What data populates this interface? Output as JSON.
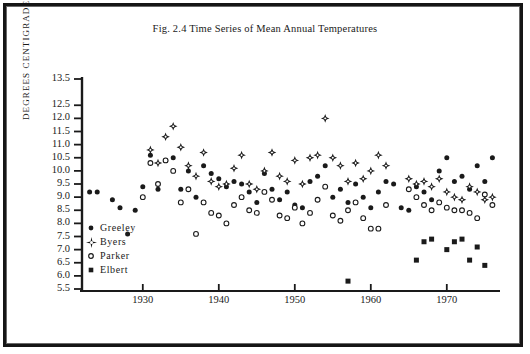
{
  "figure": {
    "title": "Fig. 2.4 Time Series of Mean Annual Temperatures",
    "ylabel": "DEGREES CENTIGRADE"
  },
  "legend": {
    "items": [
      {
        "label": "Greeley",
        "marker": "filled-circle"
      },
      {
        "label": "Byers",
        "marker": "star"
      },
      {
        "label": "Parker",
        "marker": "open-circle"
      },
      {
        "label": "Elbert",
        "marker": "filled-square"
      }
    ]
  },
  "chart_data": {
    "type": "scatter",
    "title": "Fig. 2.4 Time Series of Mean Annual Temperatures",
    "xlabel": "",
    "ylabel": "DEGREES CENTIGRADE",
    "xlim": [
      1922,
      1977
    ],
    "ylim": [
      5.5,
      13.5
    ],
    "grid": false,
    "legend_position": "inside-left",
    "xticks": [
      1930,
      1940,
      1950,
      1960,
      1970
    ],
    "yticks": [
      5.5,
      6.0,
      6.5,
      7.0,
      7.5,
      8.0,
      8.5,
      9.0,
      9.5,
      10.0,
      10.5,
      11.0,
      11.5,
      12.0,
      12.5,
      13.5
    ],
    "ytick_labels": [
      "5.5",
      "6.0",
      "6.5",
      "7.0",
      "7.5",
      "8.0",
      "8.5",
      "9.0",
      "9.5",
      "10.0",
      "10.5",
      "11.0",
      "11.5",
      "12.0",
      "12.5",
      "13.5"
    ],
    "series": [
      {
        "name": "Greeley",
        "marker": "filled-circle",
        "color": "#1a1a1a",
        "points": [
          [
            1923,
            9.2
          ],
          [
            1924,
            9.2
          ],
          [
            1926,
            8.9
          ],
          [
            1927,
            8.6
          ],
          [
            1928,
            7.6
          ],
          [
            1929,
            8.5
          ],
          [
            1930,
            9.4
          ],
          [
            1931,
            10.6
          ],
          [
            1932,
            9.3
          ],
          [
            1933,
            10.4
          ],
          [
            1934,
            10.5
          ],
          [
            1935,
            9.3
          ],
          [
            1936,
            10.0
          ],
          [
            1937,
            9.0
          ],
          [
            1938,
            10.2
          ],
          [
            1939,
            9.9
          ],
          [
            1940,
            9.7
          ],
          [
            1941,
            9.4
          ],
          [
            1942,
            9.6
          ],
          [
            1943,
            9.5
          ],
          [
            1944,
            9.2
          ],
          [
            1945,
            8.8
          ],
          [
            1946,
            9.9
          ],
          [
            1947,
            9.3
          ],
          [
            1948,
            8.9
          ],
          [
            1949,
            9.2
          ],
          [
            1950,
            8.7
          ],
          [
            1951,
            8.6
          ],
          [
            1952,
            9.6
          ],
          [
            1953,
            9.8
          ],
          [
            1954,
            10.2
          ],
          [
            1955,
            9.0
          ],
          [
            1956,
            9.3
          ],
          [
            1957,
            8.8
          ],
          [
            1958,
            9.5
          ],
          [
            1959,
            9.0
          ],
          [
            1960,
            8.6
          ],
          [
            1961,
            9.2
          ],
          [
            1962,
            9.6
          ],
          [
            1963,
            9.5
          ],
          [
            1964,
            8.6
          ],
          [
            1965,
            8.5
          ],
          [
            1966,
            9.4
          ],
          [
            1967,
            9.2
          ],
          [
            1968,
            8.9
          ],
          [
            1969,
            10.0
          ],
          [
            1970,
            10.5
          ],
          [
            1971,
            9.6
          ],
          [
            1972,
            9.8
          ],
          [
            1973,
            9.3
          ],
          [
            1974,
            10.2
          ],
          [
            1975,
            9.6
          ],
          [
            1976,
            10.5
          ]
        ]
      },
      {
        "name": "Byers",
        "marker": "star",
        "color": "#1a1a1a",
        "points": [
          [
            1931,
            10.8
          ],
          [
            1932,
            10.3
          ],
          [
            1933,
            11.3
          ],
          [
            1934,
            11.7
          ],
          [
            1935,
            10.9
          ],
          [
            1936,
            10.2
          ],
          [
            1937,
            9.8
          ],
          [
            1938,
            10.7
          ],
          [
            1939,
            9.6
          ],
          [
            1940,
            9.4
          ],
          [
            1941,
            9.5
          ],
          [
            1942,
            10.1
          ],
          [
            1943,
            10.6
          ],
          [
            1944,
            9.5
          ],
          [
            1945,
            9.3
          ],
          [
            1946,
            10.0
          ],
          [
            1947,
            10.7
          ],
          [
            1948,
            9.8
          ],
          [
            1949,
            9.6
          ],
          [
            1950,
            10.4
          ],
          [
            1951,
            9.5
          ],
          [
            1952,
            10.5
          ],
          [
            1953,
            10.6
          ],
          [
            1954,
            12.0
          ],
          [
            1955,
            10.5
          ],
          [
            1956,
            10.2
          ],
          [
            1957,
            9.6
          ],
          [
            1958,
            10.3
          ],
          [
            1959,
            9.7
          ],
          [
            1960,
            10.0
          ],
          [
            1961,
            10.6
          ],
          [
            1962,
            10.2
          ],
          [
            1965,
            9.7
          ],
          [
            1966,
            9.5
          ],
          [
            1967,
            9.6
          ],
          [
            1968,
            9.4
          ],
          [
            1969,
            9.7
          ],
          [
            1970,
            9.2
          ],
          [
            1971,
            9.0
          ],
          [
            1972,
            8.9
          ],
          [
            1973,
            9.4
          ],
          [
            1974,
            9.2
          ],
          [
            1975,
            8.9
          ],
          [
            1976,
            9.0
          ]
        ]
      },
      {
        "name": "Parker",
        "marker": "open-circle",
        "color": "#1a1a1a",
        "points": [
          [
            1930,
            9.0
          ],
          [
            1931,
            10.3
          ],
          [
            1932,
            9.5
          ],
          [
            1933,
            10.4
          ],
          [
            1934,
            10.0
          ],
          [
            1935,
            8.8
          ],
          [
            1936,
            9.3
          ],
          [
            1937,
            7.6
          ],
          [
            1938,
            8.8
          ],
          [
            1939,
            8.4
          ],
          [
            1940,
            8.3
          ],
          [
            1941,
            8.0
          ],
          [
            1942,
            8.7
          ],
          [
            1943,
            9.0
          ],
          [
            1944,
            8.5
          ],
          [
            1945,
            8.4
          ],
          [
            1946,
            9.2
          ],
          [
            1947,
            8.9
          ],
          [
            1948,
            8.3
          ],
          [
            1949,
            8.2
          ],
          [
            1950,
            8.6
          ],
          [
            1951,
            8.0
          ],
          [
            1952,
            8.4
          ],
          [
            1953,
            8.9
          ],
          [
            1954,
            9.4
          ],
          [
            1955,
            8.3
          ],
          [
            1956,
            8.1
          ],
          [
            1957,
            8.5
          ],
          [
            1958,
            8.8
          ],
          [
            1959,
            8.2
          ],
          [
            1960,
            7.8
          ],
          [
            1961,
            7.8
          ],
          [
            1962,
            8.7
          ],
          [
            1965,
            9.3
          ],
          [
            1966,
            9.0
          ],
          [
            1967,
            8.7
          ],
          [
            1968,
            8.5
          ],
          [
            1969,
            8.8
          ],
          [
            1970,
            8.6
          ],
          [
            1971,
            8.5
          ],
          [
            1972,
            8.5
          ],
          [
            1973,
            8.4
          ],
          [
            1974,
            8.2
          ],
          [
            1975,
            9.1
          ],
          [
            1976,
            8.7
          ]
        ]
      },
      {
        "name": "Elbert",
        "marker": "filled-square",
        "color": "#1a1a1a",
        "points": [
          [
            1957,
            5.8
          ],
          [
            1966,
            6.6
          ],
          [
            1967,
            7.3
          ],
          [
            1968,
            7.4
          ],
          [
            1970,
            7.0
          ],
          [
            1971,
            7.3
          ],
          [
            1972,
            7.4
          ],
          [
            1973,
            6.6
          ],
          [
            1974,
            7.1
          ],
          [
            1975,
            6.4
          ]
        ]
      }
    ]
  },
  "axes_geometry": {
    "x_pixel_left": 82,
    "x_pixel_right": 500,
    "y_pixel_top": 79,
    "y_pixel_bottom": 289,
    "x_value_left": 1922,
    "x_value_right": 1977,
    "y_value_top": 13.5,
    "y_value_bottom": 5.5
  }
}
